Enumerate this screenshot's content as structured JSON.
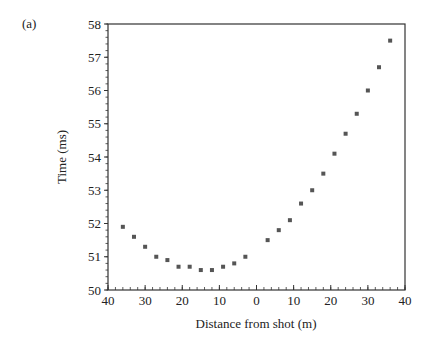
{
  "panel_label": "(a)",
  "chart_data": {
    "type": "scatter",
    "title": "",
    "xlabel": "Distance from shot (m)",
    "ylabel": "Time (ms)",
    "x_note": "Distance measured on both sides of the shot; left side plotted with distance decreasing 40→0, right side increasing 0→40",
    "x_tick_labels": [
      "40",
      "30",
      "20",
      "10",
      "0",
      "10",
      "20",
      "30",
      "40"
    ],
    "y_tick_labels": [
      "50",
      "51",
      "52",
      "53",
      "54",
      "55",
      "56",
      "57",
      "58"
    ],
    "xlim": [
      -40,
      40
    ],
    "ylim": [
      50,
      58
    ],
    "grid": false,
    "legend": null,
    "marker_color": "#555555",
    "series": [
      {
        "name": "left of shot",
        "x": [
          -36,
          -33,
          -30,
          -27,
          -24,
          -21,
          -18,
          -15,
          -12,
          -9,
          -6,
          -3
        ],
        "distance_m": [
          36,
          33,
          30,
          27,
          24,
          21,
          18,
          15,
          12,
          9,
          6,
          3
        ],
        "y": [
          51.9,
          51.6,
          51.3,
          51.0,
          50.9,
          50.7,
          50.7,
          50.6,
          50.6,
          50.7,
          50.8,
          51.0
        ]
      },
      {
        "name": "right of shot",
        "x": [
          3,
          6,
          9,
          12,
          15,
          18,
          21,
          24,
          27,
          30,
          33,
          36
        ],
        "distance_m": [
          3,
          6,
          9,
          12,
          15,
          18,
          21,
          24,
          27,
          30,
          33,
          36
        ],
        "y": [
          51.5,
          51.8,
          52.1,
          52.6,
          53.0,
          53.5,
          54.1,
          54.7,
          55.3,
          56.0,
          56.7,
          57.5
        ]
      }
    ]
  }
}
